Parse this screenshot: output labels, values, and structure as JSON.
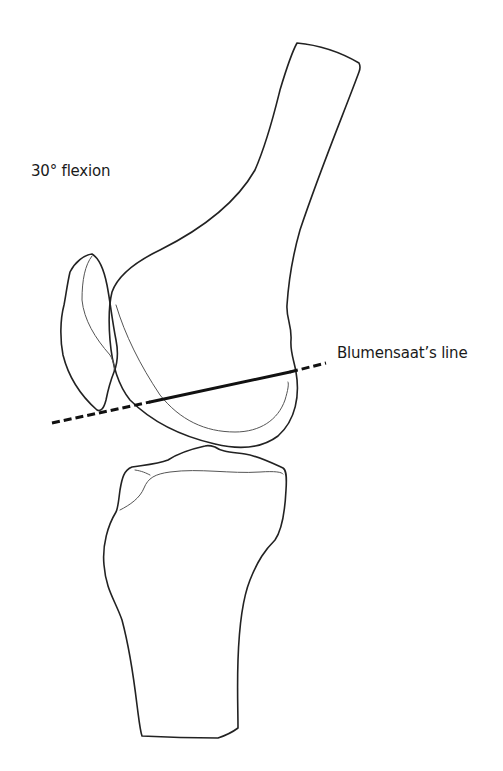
{
  "figure": {
    "labels": {
      "flexion": "30° flexion",
      "blumensaat": "Blumensaat’s line"
    },
    "structures": [
      "femur",
      "patella",
      "tibia",
      "blumensaat-line"
    ],
    "colors": {
      "outline": "#222222",
      "line": "#111111",
      "background": "#ffffff"
    }
  }
}
